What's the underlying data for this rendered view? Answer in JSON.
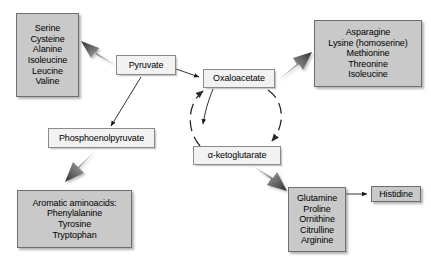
{
  "diagram": {
    "colors": {
      "product_box_fill": "#c9c9c9",
      "product_box_border": "#6e6e6e",
      "metabolite_box_fill": "#f2f2f2",
      "metabolite_box_border": "#8a8a8a",
      "thick_arrow": "#4a4a4a",
      "thin_arrow": "#1a1a1a",
      "background": "#ffffff"
    }
  },
  "nodes": {
    "pyruvate": {
      "label": "Pyruvate"
    },
    "oxaloacetate": {
      "label": "Oxaloacetate"
    },
    "alpha_ketoglutarate": {
      "label": "α-ketoglutarate"
    },
    "phosphoenolpyruvate": {
      "label": "Phosphoenolpyruvate"
    },
    "histidine": {
      "label": "Histidine"
    },
    "pyruvate_family": {
      "lines": [
        "Serine",
        "Cysteine",
        "Alanine",
        "Isoleucine",
        "Leucine",
        "Valine"
      ]
    },
    "oxaloacetate_family": {
      "lines": [
        "Asparagine",
        "Lysine (homoserine)",
        "Methionine",
        "Threonine",
        "Isoleucine"
      ]
    },
    "pep_family": {
      "lines": [
        "Aromatic aminoacids:",
        "Phenylalanine",
        "Tyrosine",
        "Tryptophan"
      ]
    },
    "ketoglutarate_family": {
      "lines": [
        "Glutamine",
        "Proline",
        "Ornithine",
        "Citrulline",
        "Arginine"
      ]
    }
  },
  "edges": [
    {
      "id": "pyruvate-to-pyruvate-family",
      "from": "Pyruvate",
      "to": "Serine / Cysteine / Alanine / Isoleucine / Leucine / Valine",
      "style": "thick-gray"
    },
    {
      "id": "pyruvate-to-oxaloacetate",
      "from": "Pyruvate",
      "to": "Oxaloacetate",
      "style": "thin-black"
    },
    {
      "id": "pyruvate-to-phosphoenolpyruvate",
      "from": "Pyruvate",
      "to": "Phosphoenolpyruvate",
      "style": "thin-black"
    },
    {
      "id": "oxaloacetate-to-oxaloacetate-family",
      "from": "Oxaloacetate",
      "to": "Asparagine / Lysine (homoserine) / Methionine / Threonine / Isoleucine",
      "style": "thick-gray"
    },
    {
      "id": "oxaloacetate-to-alpha-ketoglutarate",
      "from": "Oxaloacetate",
      "to": "α-ketoglutarate",
      "style": "dashed-curved"
    },
    {
      "id": "alpha-ketoglutarate-to-oxaloacetate",
      "from": "α-ketoglutarate",
      "to": "Oxaloacetate",
      "style": "dashed-curved"
    },
    {
      "id": "phosphoenolpyruvate-to-pep-family",
      "from": "Phosphoenolpyruvate",
      "to": "Aromatic aminoacids",
      "style": "thick-gray"
    },
    {
      "id": "alpha-ketoglutarate-to-ketoglutarate-family",
      "from": "α-ketoglutarate",
      "to": "Glutamine / Proline / Ornithine / Citrulline / Arginine",
      "style": "thick-gray"
    },
    {
      "id": "glutamine-to-histidine",
      "from": "Glutamine",
      "to": "Histidine",
      "style": "thin-black"
    },
    {
      "id": "oxaloacetate-to-phosphoenolpyruvate",
      "from": "Oxaloacetate",
      "to": "Phosphoenolpyruvate",
      "style": "thin-black"
    }
  ]
}
